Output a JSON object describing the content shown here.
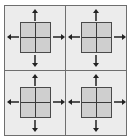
{
  "diagram": {
    "panels": [
      {
        "id": "top-left",
        "arrows": [
          "up",
          "down",
          "left",
          "right"
        ],
        "grid": "2x2"
      },
      {
        "id": "top-right",
        "arrows": [
          "up",
          "down",
          "left",
          "right"
        ],
        "grid": "2x2"
      },
      {
        "id": "bottom-left",
        "arrows": [
          "up",
          "down",
          "left",
          "right"
        ],
        "grid": "2x2"
      },
      {
        "id": "bottom-right",
        "arrows": [
          "up",
          "down",
          "left",
          "right"
        ],
        "grid": "2x2"
      }
    ],
    "colors": {
      "background": "#ececec",
      "grid_fill": "#cfcfcf",
      "line": "#3a3a3a",
      "border": "#6e6e6e"
    }
  }
}
